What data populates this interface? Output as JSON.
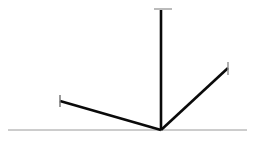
{
  "canvas": {
    "width": 256,
    "height": 144,
    "background": "#ffffff",
    "title": "angle-vector-line-diagram"
  },
  "colors": {
    "stroke_dark": "#0a0a0a",
    "stroke_gray": "#9a9a9a",
    "stroke_tick_light": "#8e8e8e",
    "background": "#ffffff"
  },
  "geometry": {
    "vertex": {
      "x": 161,
      "y": 130
    },
    "baseline": {
      "x1": 8,
      "y1": 130,
      "x2": 247,
      "y2": 130,
      "width": 1,
      "color": "#9a9a9a"
    },
    "vertical_arm": {
      "x1": 161,
      "y1": 130,
      "x2": 161,
      "y2": 10,
      "width": 2.6,
      "color": "#0a0a0a"
    },
    "vertical_arm_cap": {
      "x1": 154,
      "y1": 9,
      "x2": 172,
      "y2": 9,
      "width": 1.2,
      "color": "#8e8e8e"
    },
    "left_arm": {
      "x1": 161,
      "y1": 130,
      "x2": 60,
      "y2": 101,
      "width": 2.6,
      "color": "#0a0a0a"
    },
    "left_arm_cap": {
      "x1": 60,
      "y1": 95,
      "x2": 60,
      "y2": 107,
      "width": 1.4,
      "color": "#6f6f6f"
    },
    "right_arm": {
      "x1": 161,
      "y1": 130,
      "x2": 228,
      "y2": 68,
      "width": 2.6,
      "color": "#0a0a0a"
    },
    "right_arm_cap": {
      "x1": 228,
      "y1": 62,
      "x2": 228,
      "y2": 75,
      "width": 1.4,
      "color": "#8e8e8e"
    }
  },
  "chart_data": {
    "type": "line",
    "title": "",
    "xlabel": "",
    "ylabel": "",
    "origin": [
      161,
      130
    ],
    "grid": false,
    "legend_position": "none",
    "series": [
      {
        "name": "baseline",
        "points": [
          [
            8,
            130
          ],
          [
            247,
            130
          ]
        ],
        "style": "thin-gray",
        "cap": "none"
      },
      {
        "name": "vertical-arm",
        "points": [
          [
            161,
            130
          ],
          [
            161,
            10
          ]
        ],
        "style": "thick-black",
        "cap": "horizontal-tick",
        "length_px": 120,
        "angle_deg": 90
      },
      {
        "name": "left-arm",
        "points": [
          [
            161,
            130
          ],
          [
            60,
            101
          ]
        ],
        "style": "thick-black",
        "cap": "vertical-tick",
        "length_px": 105,
        "angle_deg": 164
      },
      {
        "name": "right-arm",
        "points": [
          [
            161,
            130
          ],
          [
            228,
            68
          ]
        ],
        "style": "thick-black",
        "cap": "vertical-tick",
        "length_px": 91,
        "angle_deg": 43
      }
    ]
  }
}
